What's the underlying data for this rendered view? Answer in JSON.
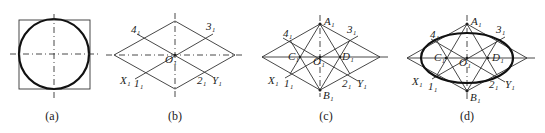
{
  "figure": {
    "panels": [
      {
        "id": "a",
        "caption": "(a)"
      },
      {
        "id": "b",
        "caption": "(b)",
        "labels": {
          "p4": "4₁",
          "p3": "3₁",
          "o": "O₁",
          "x": "X₁",
          "p1": "1₁",
          "p2": "2₁",
          "y": "Y₁"
        }
      },
      {
        "id": "c",
        "caption": "(c)",
        "labels": {
          "a": "A₁",
          "p4": "4₁",
          "p3": "3₁",
          "c": "C₁",
          "o": "O₁",
          "d": "D₁",
          "x": "X₁",
          "p1": "1₁",
          "p2": "2₁",
          "y": "Y₁",
          "b": "B₁"
        }
      },
      {
        "id": "d",
        "caption": "(d)",
        "labels": {
          "a": "A₁",
          "p4": "4₁",
          "p3": "3₁",
          "c": "C₁",
          "o": "O₁",
          "d": "D₁",
          "x": "X₁",
          "p1": "1₁",
          "p2": "2₁",
          "y": "Y₁",
          "b": "B₁"
        }
      }
    ]
  },
  "colors": {
    "line": "#333333",
    "thick": "#111111",
    "background": "#ffffff"
  }
}
